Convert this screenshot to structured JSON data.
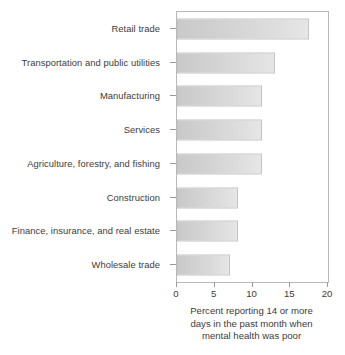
{
  "chart_data": {
    "type": "bar",
    "orientation": "horizontal",
    "title": "",
    "subtitle": "",
    "xlabel": "Percent reporting 14 or more days in the past month when mental health was poor",
    "ylabel": "",
    "xlim": [
      0,
      20
    ],
    "xticks": [
      0,
      5,
      10,
      15,
      20
    ],
    "xtick_labels": [
      "0",
      "5",
      "10",
      "15",
      "20"
    ],
    "grid": false,
    "legend": false,
    "categories": [
      "Retail trade",
      "Transportation and public utilities",
      "Manufacturing",
      "Services",
      "Agriculture, forestry, and fishing",
      "Construction",
      "Finance, insurance, and real estate",
      "Wholesale trade"
    ],
    "values": [
      17.5,
      13.0,
      11.3,
      11.3,
      11.3,
      8.1,
      8.1,
      7.0
    ],
    "caption_lines": [
      "Percent reporting 14 or more",
      "days in the past month when",
      "mental health was poor"
    ],
    "colors": {
      "bar_fill_start": "#c9c9c9",
      "bar_fill_end": "#e6e6e6",
      "bar_border": "#c4c4c4",
      "axis": "#b9b9b9",
      "text": "#3c3c3c",
      "background": "#ffffff"
    }
  }
}
